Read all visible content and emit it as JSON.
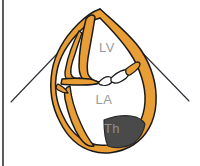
{
  "figure": {
    "background_color": "#ffffff",
    "width": 200,
    "height": 166
  },
  "colors": {
    "myocardium_fill": "#E89E34",
    "myocardium_stroke": "#1a1a1a",
    "cavity_fill": "#ffffff",
    "thrombus_fill": "#4a4a4a",
    "thrombus_stroke": "#2a2a2a",
    "sector_line": "#2b2b33",
    "label_text": "#9a9a9a",
    "frame_border": "#33333d"
  },
  "labels": {
    "left_ventricle": {
      "text": "LV",
      "x": 107,
      "y": 52
    },
    "left_atrium": {
      "text": "LA",
      "x": 104,
      "y": 104
    },
    "thrombus": {
      "text": "Th",
      "x": 112,
      "y": 133
    }
  },
  "structures": {
    "ultrasound_sector": {
      "name": "ultrasound-sector",
      "apex_x": 100,
      "apex_y": 9,
      "left_end_x": 11,
      "left_end_y": 102,
      "right_end_x": 189,
      "right_end_y": 101
    },
    "heart_outline": {
      "name": "myocardial-wall"
    },
    "septum": {
      "name": "interventricular-septum"
    },
    "mitral_valve": {
      "name": "mitral-valve-leaflets",
      "leaflet_count": 2
    },
    "thrombus_mass": {
      "name": "atrial-thrombus"
    }
  },
  "frame": {
    "left_border_visible": true,
    "left_border_x": 3
  }
}
